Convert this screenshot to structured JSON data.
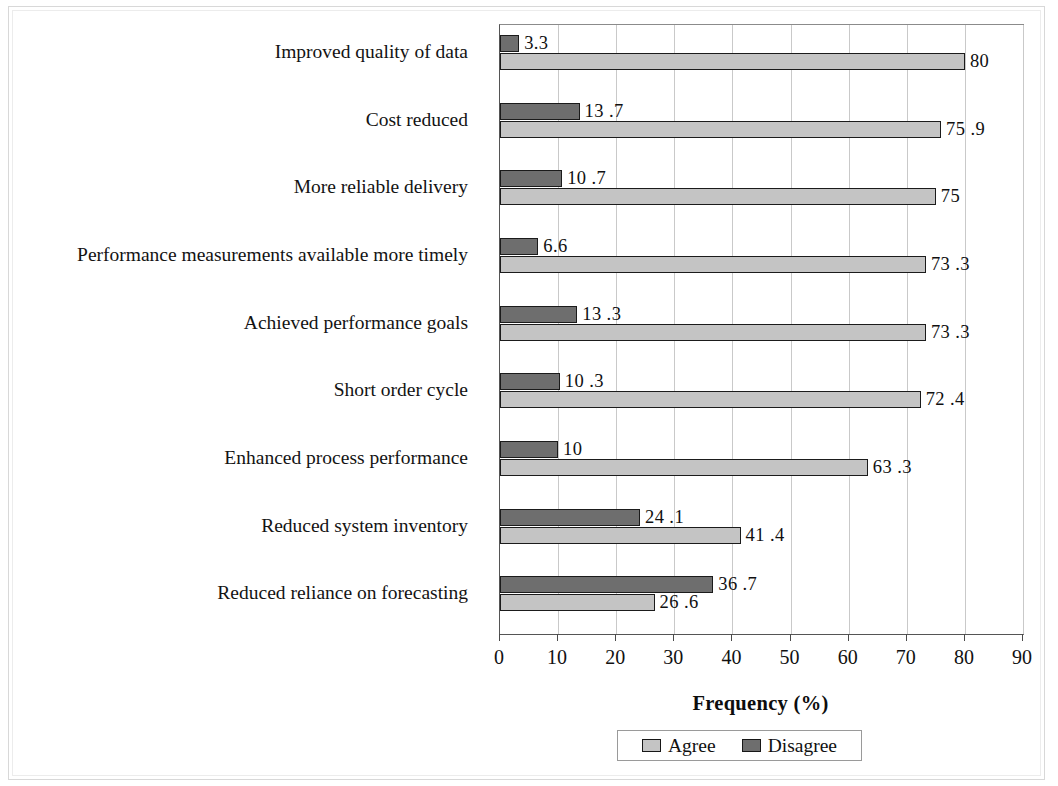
{
  "chart_data": {
    "type": "bar",
    "orientation": "horizontal",
    "title": "",
    "xlabel": "Frequency (%)",
    "ylabel": "",
    "xlim": [
      0,
      90
    ],
    "xticks": [
      0,
      10,
      20,
      30,
      40,
      50,
      60,
      70,
      80,
      90
    ],
    "grid": true,
    "legend_position": "bottom",
    "categories": [
      "Improved quality of data",
      "Cost reduced",
      "More reliable delivery",
      "Performance measurements available more timely",
      "Achieved performance goals",
      "Short order cycle",
      "Enhanced process performance",
      "Reduced system inventory",
      "Reduced reliance on forecasting"
    ],
    "series": [
      {
        "name": "Agree",
        "color": "#c4c4c4",
        "values": [
          80,
          75.9,
          75,
          73.3,
          73.3,
          72.4,
          63.3,
          41.4,
          26.6
        ],
        "labels": [
          "80",
          "75 .9",
          "75",
          "73 .3",
          "73 .3",
          "72 .4",
          "63 .3",
          "41 .4",
          "26 .6"
        ]
      },
      {
        "name": "Disagree",
        "color": "#6e6e6e",
        "values": [
          3.3,
          13.7,
          10.7,
          6.6,
          13.3,
          10.3,
          10,
          24.1,
          36.7
        ],
        "labels": [
          "3.3",
          "13 .7",
          "10 .7",
          "6.6",
          "13 .3",
          "10 .3",
          "10",
          "24 .1",
          "36 .7"
        ]
      }
    ]
  },
  "legend": {
    "entries": [
      {
        "label": "Agree",
        "swatch": "legend-swatch-agree"
      },
      {
        "label": "Disagree",
        "swatch": "legend-swatch-disagree"
      }
    ]
  },
  "axis": {
    "x_title": "Frequency (%)"
  }
}
